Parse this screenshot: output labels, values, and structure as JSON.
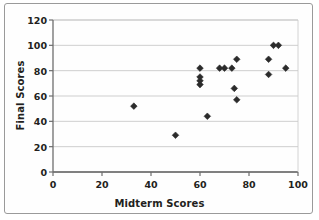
{
  "chart_data": {
    "type": "scatter",
    "title": "",
    "xlabel": "Midterm Scores",
    "ylabel": "Final Scores",
    "xlim": [
      0,
      100
    ],
    "ylim": [
      0,
      120
    ],
    "xticks": [
      0,
      20,
      40,
      60,
      80,
      100
    ],
    "yticks": [
      0,
      20,
      40,
      60,
      80,
      100,
      120
    ],
    "grid": "horizontal",
    "legend": "none",
    "marker": "diamond",
    "marker_color": "#2b2b2b",
    "points": [
      {
        "x": 33,
        "y": 52
      },
      {
        "x": 50,
        "y": 29
      },
      {
        "x": 60,
        "y": 82
      },
      {
        "x": 60,
        "y": 75
      },
      {
        "x": 60,
        "y": 72
      },
      {
        "x": 60,
        "y": 69
      },
      {
        "x": 63,
        "y": 44
      },
      {
        "x": 68,
        "y": 82
      },
      {
        "x": 70,
        "y": 82
      },
      {
        "x": 73,
        "y": 82
      },
      {
        "x": 74,
        "y": 66
      },
      {
        "x": 75,
        "y": 89
      },
      {
        "x": 75,
        "y": 57
      },
      {
        "x": 88,
        "y": 89
      },
      {
        "x": 88,
        "y": 77
      },
      {
        "x": 90,
        "y": 100
      },
      {
        "x": 92,
        "y": 100
      },
      {
        "x": 95,
        "y": 82
      }
    ]
  },
  "axes": {
    "x_title": "Midterm Scores",
    "y_title": "Final Scores",
    "x_tick_labels": [
      "0",
      "20",
      "40",
      "60",
      "80",
      "100"
    ],
    "y_tick_labels": [
      "0",
      "20",
      "40",
      "60",
      "80",
      "100",
      "120"
    ]
  },
  "colors": {
    "marker": "#2b2b2b",
    "gridline": "#c9c9c9",
    "axis": "#6e6e6e",
    "frame_border": "#9a9a9a",
    "text": "#231f20",
    "background": "#ffffff"
  },
  "geometry": {
    "plot_left": 53,
    "plot_right": 298,
    "plot_top": 20,
    "plot_bottom": 172
  }
}
